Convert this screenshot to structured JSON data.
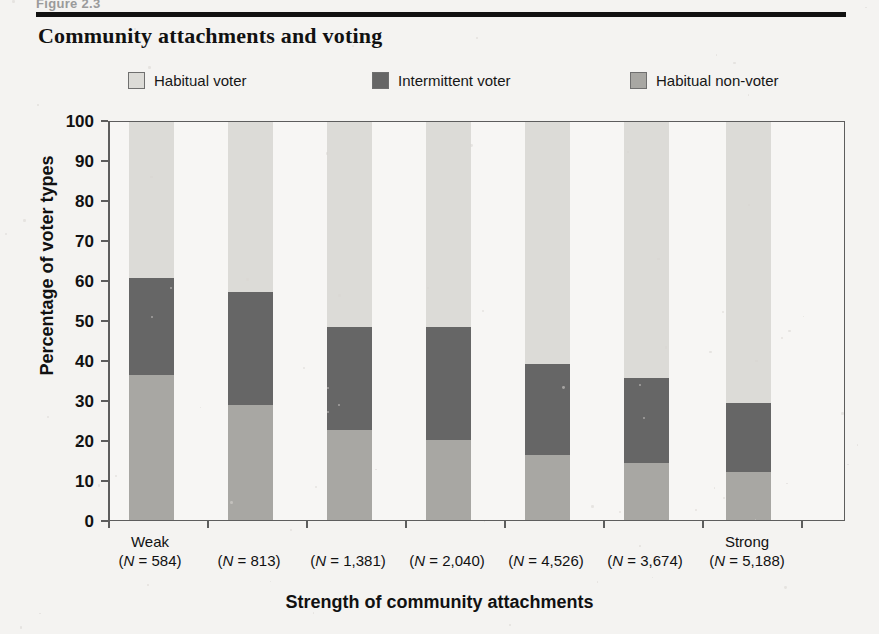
{
  "figure_stub": "Figure 2.3",
  "title": "Community attachments and voting",
  "axis": {
    "ylabel": "Percentage of voter types",
    "xlabel": "Strength of community attachments"
  },
  "colors": {
    "habitual_voter": "#dcdbd7",
    "intermittent_voter": "#666666",
    "habitual_non_voter": "#a8a7a3",
    "frame": "#5d5d5d",
    "text": "#111111",
    "plot_bg": "#f7f6f4",
    "page_bg": "#f4f3f1",
    "rule": "#111111"
  },
  "legend": {
    "items": [
      {
        "label": "Habitual voter",
        "color": "#dcdbd7"
      },
      {
        "label": "Intermittent voter",
        "color": "#666666"
      },
      {
        "label": "Habitual non-voter",
        "color": "#a8a7a3"
      }
    ]
  },
  "x_end_labels": {
    "low": "Weak",
    "high": "Strong"
  },
  "chart_data": {
    "type": "bar",
    "subtype": "stacked-vertical-100",
    "title": "Community attachments and voting",
    "xlabel": "Strength of community attachments",
    "ylabel": "Percentage of voter types",
    "ylim": [
      0,
      100
    ],
    "yticks": [
      0,
      10,
      20,
      30,
      40,
      50,
      60,
      70,
      80,
      90,
      100
    ],
    "ytick_labels": [
      "0",
      "10",
      "20",
      "30",
      "40",
      "50",
      "60",
      "70",
      "80",
      "90",
      "100"
    ],
    "grid": false,
    "legend_position": "top",
    "categories": [
      "(N = 584)",
      "(N = 813)",
      "(N = 1,381)",
      "(N = 2,040)",
      "(N = 4,526)",
      "(N = 3,674)",
      "(N = 5,188)"
    ],
    "category_n": [
      584,
      813,
      1381,
      2040,
      4526,
      3674,
      5188
    ],
    "category_endpoints": [
      "Weak",
      "",
      "",
      "",
      "",
      "",
      "Strong"
    ],
    "series": [
      {
        "name": "Habitual non-voter",
        "color": "#a8a7a3",
        "stack_order": 1,
        "values": [
          36.5,
          28.8,
          22.7,
          20.2,
          16.4,
          14.4,
          12.1
        ]
      },
      {
        "name": "Intermittent voter",
        "color": "#666666",
        "stack_order": 2,
        "values": [
          24.3,
          28.6,
          25.9,
          28.3,
          22.8,
          21.4,
          17.2
        ]
      },
      {
        "name": "Habitual voter",
        "color": "#dcdbd7",
        "stack_order": 3,
        "values": [
          39.2,
          42.6,
          51.4,
          51.5,
          60.8,
          64.2,
          70.7
        ]
      }
    ],
    "cumulative_tops": {
      "habitual_non_voter": [
        36.5,
        28.8,
        22.7,
        20.2,
        16.4,
        14.4,
        12.1
      ],
      "intermittent_voter": [
        60.8,
        57.4,
        48.6,
        48.5,
        39.2,
        35.8,
        29.3
      ],
      "habitual_voter": [
        100,
        100,
        100,
        100,
        100,
        100,
        100
      ]
    }
  }
}
